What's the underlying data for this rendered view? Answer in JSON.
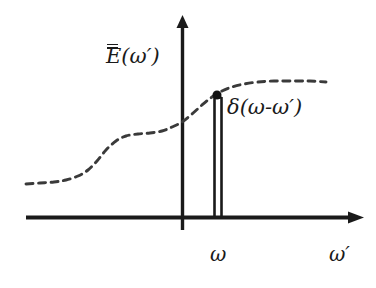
{
  "figure": {
    "kind": "line-plot-with-impulse",
    "background_color": "#ffffff",
    "ink_color": "#1a1a1a",
    "curve_color": "#3a3a3a"
  },
  "labels": {
    "y_axis_function_base": "E",
    "y_axis_function_arg": "(ω′)",
    "y_axis_full": "Ē(ω′)",
    "impulse_label": "δ(ω-ω′)",
    "omega_tick": "ω",
    "x_axis_label": "ω′"
  },
  "chart_data": {
    "type": "line",
    "title": "",
    "xlabel": "ω′",
    "ylabel": "Ē(ω′)",
    "grid": false,
    "legend_position": "none",
    "axes": {
      "x_axis_y_pixel": 217,
      "x_axis_start_x": 26,
      "x_axis_end_x": 360,
      "x_axis_arrow": true,
      "y_axis_x_pixel": 182,
      "y_axis_top_y": 18,
      "y_axis_bottom_y": 230,
      "y_axis_arrow": true,
      "xlim": [
        0,
        376
      ],
      "ylim": [
        0,
        288
      ]
    },
    "series": [
      {
        "name": "Ē(ω′)",
        "style": "dashed",
        "color": "#3a3a3a",
        "points": [
          [
            26,
            184
          ],
          [
            40,
            183
          ],
          [
            54,
            182
          ],
          [
            66,
            180
          ],
          [
            78,
            176
          ],
          [
            88,
            170
          ],
          [
            97,
            161
          ],
          [
            106,
            150
          ],
          [
            116,
            141
          ],
          [
            126,
            136
          ],
          [
            138,
            134
          ],
          [
            150,
            133
          ],
          [
            162,
            131
          ],
          [
            172,
            127
          ],
          [
            182,
            122
          ],
          [
            192,
            114
          ],
          [
            202,
            105
          ],
          [
            212,
            97
          ],
          [
            222,
            91
          ],
          [
            232,
            87
          ],
          [
            244,
            84
          ],
          [
            258,
            82
          ],
          [
            274,
            81
          ],
          [
            292,
            81
          ],
          [
            310,
            81
          ],
          [
            326,
            82
          ]
        ]
      }
    ],
    "impulse": {
      "name": "δ(ω-ω′)",
      "x_position_pixel": 218,
      "half_width_pixel": 3.5,
      "base_y_pixel": 217,
      "top_y_pixel": 96,
      "style": "double-line-with-dot",
      "dot_radius_pixel": 4.5,
      "axis_label": "ω"
    }
  }
}
